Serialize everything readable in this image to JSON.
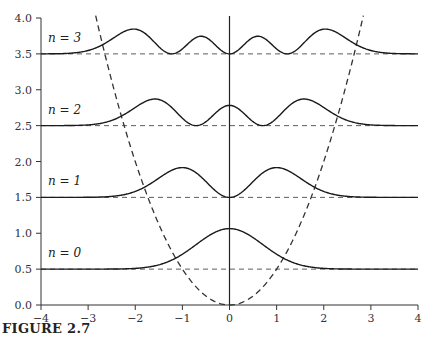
{
  "caption": "FIGURE 2.7",
  "chart_data": {
    "type": "line",
    "title": "",
    "xlabel": "",
    "ylabel": "",
    "xlim": [
      -4,
      4
    ],
    "ylim": [
      0.0,
      4.0
    ],
    "grid": false,
    "x_ticks": [
      -4,
      -3,
      -2,
      -1,
      0,
      1,
      2,
      3,
      4
    ],
    "x_tick_labels": [
      "−4",
      "−3",
      "−2",
      "−1",
      "0",
      "1",
      "2",
      "3",
      "4"
    ],
    "y_ticks": [
      0.0,
      0.5,
      1.0,
      1.5,
      2.0,
      2.5,
      3.0,
      3.5,
      4.0
    ],
    "y_tick_labels": [
      "0.0",
      "0.5",
      "1.0",
      "1.5",
      "2.0",
      "2.5",
      "3.0",
      "3.5",
      "4.0"
    ],
    "potential": {
      "name": "V(x) = x²/2",
      "style": "dashed"
    },
    "energy_levels": [
      {
        "n": 0,
        "label": "n = 0",
        "energy": 0.5
      },
      {
        "n": 1,
        "label": "n = 1",
        "energy": 1.5
      },
      {
        "n": 2,
        "label": "n = 2",
        "energy": 2.5
      },
      {
        "n": 3,
        "label": "n = 3",
        "energy": 3.5
      }
    ],
    "series": [
      {
        "name": "E0 + |ψ0(x)|²",
        "n": 0,
        "baseline": 0.5,
        "peak_value": 1.06,
        "peaks_x": [
          0
        ]
      },
      {
        "name": "E1 + |ψ1(x)|²",
        "n": 1,
        "baseline": 1.5,
        "peak_value": 1.91,
        "peaks_x": [
          -1,
          1
        ]
      },
      {
        "name": "E2 + |ψ2(x)|²",
        "n": 2,
        "baseline": 2.5,
        "peak_value": 2.87,
        "peaks_x": [
          -1.6,
          0,
          1.6
        ]
      },
      {
        "name": "E3 + |ψ3(x)|²",
        "n": 3,
        "baseline": 3.5,
        "peak_value": 3.85,
        "peaks_x": [
          -2.0,
          -0.6,
          0.6,
          2.0
        ]
      }
    ],
    "axes": {
      "vertical_line_at_x": 0
    }
  },
  "colors": {
    "curve": "#1a1a1a",
    "axis": "#333333",
    "dashed": "#333333"
  }
}
